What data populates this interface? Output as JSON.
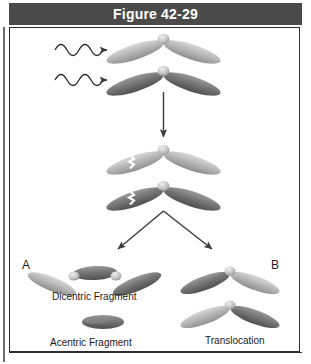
{
  "figure": {
    "title": "Figure 42-29",
    "title_bar_color": "#4a4a4a",
    "title_text_color": "#ffffff",
    "frame_border_color": "#2e2e2e",
    "background_color": "#ffffff"
  },
  "panels": [
    {
      "letter": "A",
      "caption_primary": "Dicentric Fragment",
      "caption_secondary": "Acentric Fragment"
    },
    {
      "letter": "B",
      "caption_primary": "Translocation",
      "caption_secondary": ""
    }
  ],
  "labels": {
    "panel_a": "A",
    "panel_b": "B",
    "dicentric_fragment": "Dicentric Fragment",
    "acentric_fragment": "Acentric Fragment",
    "translocation": "Translocation"
  },
  "diagram": {
    "type": "process-flow",
    "stages": [
      {
        "name": "irradiation",
        "description": "Two homologous V-shaped chromosomes are struck by radiation",
        "elements": [
          "wavy-radiation-arrow",
          "wavy-radiation-arrow",
          "chromosome-light",
          "chromosome-dark"
        ]
      },
      {
        "name": "breakage",
        "description": "Both chromosomes sustain a break in one arm",
        "elements": [
          "chromosome-light-broken",
          "chromosome-dark-broken",
          "break-mark",
          "break-mark"
        ]
      },
      {
        "name": "outcomes",
        "description": "Rejoining produces either a dicentric plus acentric fragment, or a reciprocal translocation",
        "elements": [
          "dicentric-chromosome",
          "acentric-fragment",
          "translocated-chromosome",
          "translocated-chromosome"
        ]
      }
    ],
    "arrows": [
      {
        "name": "radiation-arrow-top",
        "style": "wavy",
        "direction": "right"
      },
      {
        "name": "radiation-arrow-bottom",
        "style": "wavy",
        "direction": "right"
      },
      {
        "name": "process-arrow",
        "style": "straight",
        "direction": "down"
      },
      {
        "name": "outcome-arrow-left",
        "style": "straight",
        "direction": "down-left"
      },
      {
        "name": "outcome-arrow-right",
        "style": "straight",
        "direction": "down-right"
      }
    ],
    "colors": {
      "chromosome_light": "#b9b9b9",
      "chromosome_dark": "#6f6f6f",
      "centromere": "#cfcfcf",
      "arrow": "#3a3a3a",
      "break_mark": "#ffffff"
    }
  }
}
